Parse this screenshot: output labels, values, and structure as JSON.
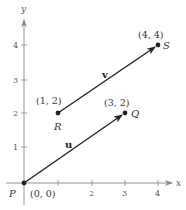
{
  "diagram": {
    "type": "vector-plane",
    "axes": {
      "x_label": "x",
      "y_label": "y",
      "x_ticks": [
        "1",
        "2",
        "3",
        "4"
      ],
      "y_ticks": [
        "1",
        "2",
        "3",
        "4"
      ]
    },
    "points": [
      {
        "name": "P",
        "coord_label": "(0, 0)",
        "x": 0,
        "y": 0
      },
      {
        "name": "Q",
        "coord_label": "(3, 2)",
        "x": 3,
        "y": 2
      },
      {
        "name": "R",
        "coord_label": "(1, 2)",
        "x": 1,
        "y": 2
      },
      {
        "name": "S",
        "coord_label": "(4, 4)",
        "x": 4,
        "y": 4
      }
    ],
    "vectors": [
      {
        "name": "u",
        "from": "P",
        "to": "Q"
      },
      {
        "name": "v",
        "from": "R",
        "to": "S"
      }
    ],
    "colors": {
      "axis": "#888888",
      "vector": "#222222",
      "text": "#333333"
    }
  }
}
